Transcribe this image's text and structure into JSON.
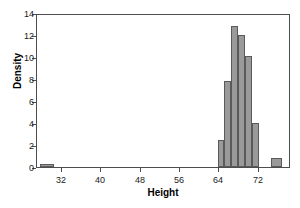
{
  "chart_data": {
    "type": "bar",
    "title": "",
    "subtitle": "",
    "xlabel": "Height",
    "ylabel": "Density",
    "xlim": [
      27,
      78.5
    ],
    "ylim": [
      0,
      14
    ],
    "xticks": [
      32,
      40,
      48,
      56,
      64,
      72
    ],
    "yticks": [
      0,
      2,
      4,
      6,
      8,
      10,
      12,
      14
    ],
    "grid": false,
    "legend": null,
    "bin_width": 2.8,
    "bar_color": "#9a9a9a",
    "bar_edge_color": "#5a5a5a",
    "frame_color": "#4d4d4d",
    "background": "#ffffff",
    "bins": [
      {
        "x0": 27.6,
        "x1": 30.4,
        "value": 0.25
      },
      {
        "x0": 63.6,
        "x1": 65.0,
        "value": 2.5
      },
      {
        "x0": 65.0,
        "x1": 66.4,
        "value": 7.8
      },
      {
        "x0": 66.4,
        "x1": 67.8,
        "value": 12.8
      },
      {
        "x0": 67.8,
        "x1": 69.2,
        "value": 12.0
      },
      {
        "x0": 69.2,
        "x1": 70.6,
        "value": 10.1
      },
      {
        "x0": 70.6,
        "x1": 72.0,
        "value": 4.0
      },
      {
        "x0": 74.4,
        "x1": 76.6,
        "value": 0.8
      }
    ],
    "categories": [
      "27.6-30.4",
      "63.6-65.0",
      "65.0-66.4",
      "66.4-67.8",
      "67.8-69.2",
      "69.2-70.6",
      "70.6-72.0",
      "74.4-76.6"
    ],
    "values": [
      0.25,
      2.5,
      7.8,
      12.8,
      12.0,
      10.1,
      4.0,
      0.8
    ]
  }
}
